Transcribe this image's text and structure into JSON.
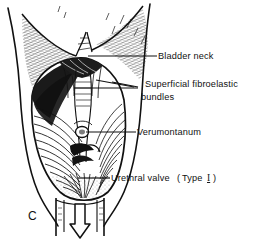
{
  "figure": {
    "panel_letter": "C",
    "caption_labels": [
      {
        "id": "bladder-neck",
        "text": "Bladder neck",
        "x": 158,
        "y": 62
      },
      {
        "id": "superficial-fibroelastic-bundles",
        "text": "Superficial fibroelastic",
        "text_line2": "bundles",
        "x": 145,
        "y": 90,
        "x2": 141,
        "y2": 103
      },
      {
        "id": "verumontanum",
        "text": "Verumontanum",
        "x": 137,
        "y": 137
      },
      {
        "id": "urethral-valve",
        "text": "Urethral valve",
        "text_paren_open": "(",
        "text_type": "Type",
        "text_roman": "I",
        "text_paren_close": ")",
        "x": 111,
        "y": 182
      }
    ],
    "flow_arrow": {
      "id": "urine-flow-arrow",
      "direction": "down"
    },
    "colors": {
      "ink": "#111111",
      "background": "#ffffff",
      "shadow_fill": "#1a1a1a"
    }
  }
}
